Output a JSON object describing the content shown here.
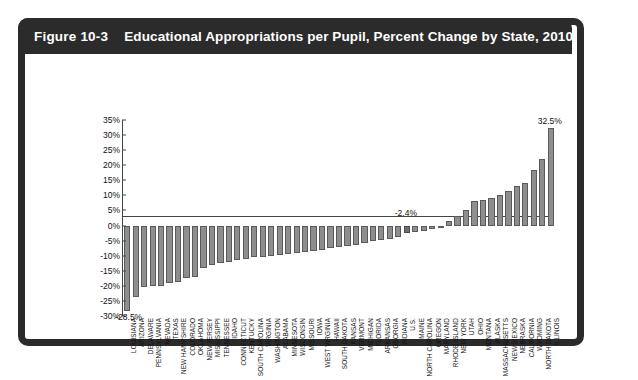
{
  "figure": {
    "number_label": "Figure 10-3",
    "title": "Educational Appropriations per Pupil, Percent Change by State, 2010–2015"
  },
  "chart_data": {
    "type": "bar",
    "title": "Educational Appropriations per Pupil, Percent Change by State, 2010–2015",
    "xlabel": "",
    "ylabel": "",
    "ylim": [
      -30,
      35
    ],
    "ytick_labels": [
      "35%",
      "30%",
      "25%",
      "20%",
      "15%",
      "10%",
      "5%",
      "0%",
      "-5%",
      "-10%",
      "-15%",
      "-20%",
      "-25%",
      "-30%"
    ],
    "ytick_values": [
      35,
      30,
      25,
      20,
      15,
      10,
      5,
      0,
      -5,
      -10,
      -15,
      -20,
      -25,
      -30
    ],
    "grid": false,
    "legend": "none",
    "bar_color": "#8e8e8e",
    "highlight_color": "#6e6e6e",
    "annotations": [
      {
        "label": "-28.5%",
        "category": "LOUISIANA",
        "value": -28.5
      },
      {
        "label": "-2.4%",
        "category": "U.S.",
        "value": -2.4
      },
      {
        "label": "32.5%",
        "category": "ILLINOIS",
        "value": 32.5
      }
    ],
    "highlight_category": "U.S.",
    "categories": [
      "LOUISIANA",
      "ARIZONA",
      "DELAWARE",
      "PENNSYLVANIA",
      "NEVADA",
      "TEXAS",
      "NEW HAMPSHIRE",
      "COLORADO",
      "OKLAHOMA",
      "NEW JERSEY",
      "MISSISSIPPI",
      "TENNESSEE",
      "IDAHO",
      "CONNECTICUT",
      "KENTUCKY",
      "SOUTH CAROLINA",
      "VIRGINIA",
      "WASHINGTON",
      "ALABAMA",
      "MINNESOTA",
      "WISCONSIN",
      "MISSOURI",
      "IOWA",
      "WEST VIRGINIA",
      "HAWAII",
      "SOUTH DAKOTA",
      "KANSAS",
      "VERMONT",
      "MICHIGAN",
      "FLORIDA",
      "ARKANSAS",
      "GEORGIA",
      "INDIANA",
      "U.S.",
      "MAINE",
      "NORTH CAROLINA",
      "OREGON",
      "MARYLAND",
      "RHODE ISLAND",
      "NEW YORK",
      "UTAH",
      "OHIO",
      "MONTANA",
      "ALASKA",
      "MASSACHUSETTS",
      "NEW MEXICO",
      "NEBRASKA",
      "CALIFORNIA",
      "WYOMING",
      "NORTH DAKOTA",
      "ILLINOIS"
    ],
    "values": [
      -28.5,
      -23.8,
      -20.5,
      -20.2,
      -20.0,
      -19.0,
      -18.6,
      -17.5,
      -17.0,
      -14.2,
      -13.0,
      -12.5,
      -12.0,
      -11.5,
      -11.0,
      -10.6,
      -10.3,
      -10.0,
      -9.8,
      -9.5,
      -9.2,
      -8.8,
      -8.4,
      -8.0,
      -7.6,
      -7.2,
      -6.8,
      -6.4,
      -5.8,
      -5.2,
      -4.8,
      -4.4,
      -3.8,
      -2.4,
      -2.2,
      -1.8,
      -1.0,
      -0.3,
      1.5,
      3.2,
      5.0,
      8.0,
      8.6,
      9.2,
      10.0,
      11.5,
      13.0,
      14.0,
      18.5,
      22.0,
      32.5
    ]
  }
}
